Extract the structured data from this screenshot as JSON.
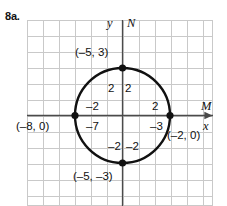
{
  "problem": {
    "number_label": "8a."
  },
  "graph": {
    "axes": {
      "y_axis_label": "y",
      "x_axis_label": "x",
      "y_ray_label": "N",
      "x_ray_label": "M"
    },
    "point_labels": [
      {
        "id": "top",
        "text": "(–5, 3)"
      },
      {
        "id": "bottom",
        "text": "(–5, –3)"
      },
      {
        "id": "left",
        "text": "(–8, 0)"
      },
      {
        "id": "right",
        "text": "(–2, 0)"
      }
    ],
    "tick_labels": [
      {
        "id": "upper-left",
        "text": "2"
      },
      {
        "id": "upper-right",
        "text": "2"
      },
      {
        "id": "mid-left",
        "text": "–2"
      },
      {
        "id": "mid-right",
        "text": "2"
      },
      {
        "id": "lower-left",
        "text": "–7"
      },
      {
        "id": "lower-right",
        "text": "–3"
      },
      {
        "id": "bottom-left",
        "text": "–2"
      },
      {
        "id": "bottom-right",
        "text": "–2"
      }
    ],
    "colors": {
      "grid_line": "#c9c9c9",
      "axis_line": "#4a4a4a",
      "circle_stroke": "#111111",
      "point_fill": "#111111",
      "background": "#ffffff"
    },
    "geometry": {
      "grid_cell_px": 16,
      "circle_center_px": [
        95.5,
        95.5
      ],
      "circle_radius_px": 47.5,
      "marked_points_px": [
        [
          95.5,
          48
        ],
        [
          95.5,
          143
        ],
        [
          48,
          95.5
        ],
        [
          143,
          95.5
        ]
      ]
    }
  }
}
